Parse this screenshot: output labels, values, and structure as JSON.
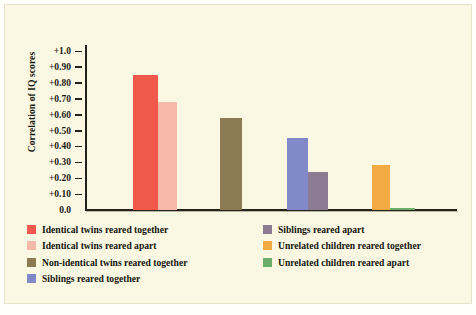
{
  "colors": {
    "background": "#faf8e2",
    "page": "#fffffb",
    "axis": "#23231c",
    "text": "#15150f",
    "identical_together": "#f0584c",
    "identical_apart": "#f6b9a9",
    "non_identical_together": "#8c7a52",
    "siblings_together": "#8189c8",
    "siblings_apart": "#8b7b93",
    "unrelated_together": "#f2aa42",
    "unrelated_apart": "#6aae6a"
  },
  "chart_data": {
    "type": "bar",
    "title": "",
    "xlabel": "",
    "ylabel": "Correlation of IQ scores",
    "ylim": [
      0.0,
      1.0
    ],
    "grid": false,
    "legend_position": "bottom",
    "ytick_labels": [
      "+1.0",
      "+0.90",
      "+0.80",
      "+0.70",
      "+0.60",
      "+0.50",
      "+0.40",
      "+0.30",
      "+0.20",
      "+0.10",
      "0.0"
    ],
    "ytick_values": [
      1.0,
      0.9,
      0.8,
      0.7,
      0.6,
      0.5,
      0.4,
      0.3,
      0.2,
      0.1,
      0.0
    ],
    "categories": [
      "Identical twins reared together",
      "Identical twins reared apart",
      "Non-identical twins reared together",
      "Siblings reared together",
      "Siblings reared apart",
      "Unrelated children reared together",
      "Unrelated children reared apart"
    ],
    "values": [
      0.85,
      0.68,
      0.58,
      0.45,
      0.24,
      0.28,
      0.01
    ],
    "bars": [
      {
        "label": "Identical twins reared together",
        "value": 0.85,
        "color": "#f0584c",
        "x": 48,
        "width": 25
      },
      {
        "label": "Identical twins reared apart",
        "value": 0.68,
        "color": "#f6b9a9",
        "x": 73,
        "width": 19
      },
      {
        "label": "Non-identical twins reared together",
        "value": 0.58,
        "color": "#8c7a52",
        "x": 135,
        "width": 22
      },
      {
        "label": "Siblings reared together",
        "value": 0.45,
        "color": "#8189c8",
        "x": 202,
        "width": 21
      },
      {
        "label": "Siblings reared apart",
        "value": 0.24,
        "color": "#8b7b93",
        "x": 223,
        "width": 20
      },
      {
        "label": "Unrelated children reared together",
        "value": 0.28,
        "color": "#f2aa42",
        "x": 287,
        "width": 18
      },
      {
        "label": "Unrelated children reared apart",
        "value": 0.01,
        "color": "#6aae6a",
        "x": 305,
        "width": 25
      }
    ]
  },
  "legend": {
    "left": [
      {
        "label": "Identical twins reared together",
        "color": "#f0584c"
      },
      {
        "label": "Identical twins reared apart",
        "color": "#f6b9a9"
      },
      {
        "label": "Non-identical twins reared together",
        "color": "#8c7a52"
      },
      {
        "label": "Siblings reared together",
        "color": "#8189c8"
      }
    ],
    "right": [
      {
        "label": "Siblings reared apart",
        "color": "#8b7b93"
      },
      {
        "label": "Unrelated children reared together",
        "color": "#f2aa42"
      },
      {
        "label": "Unrelated children reared apart",
        "color": "#6aae6a"
      }
    ]
  }
}
